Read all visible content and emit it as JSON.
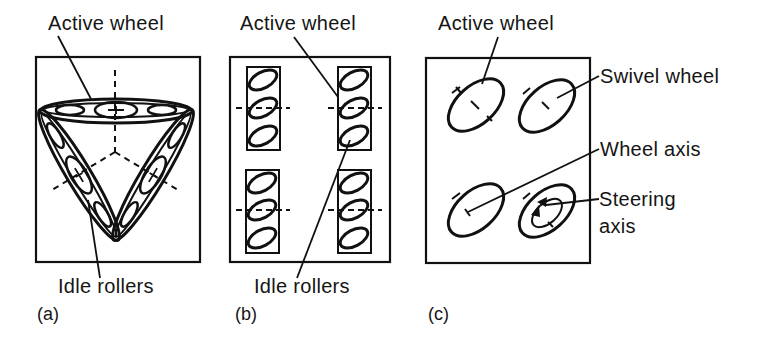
{
  "panels": {
    "a": {
      "tag": "(a)",
      "label_top": "Active wheel",
      "label_bottom": "Idle rollers"
    },
    "b": {
      "tag": "(b)",
      "label_top": "Active wheel",
      "label_bottom": "Idle rollers"
    },
    "c": {
      "tag": "(c)",
      "label_top": "Active wheel",
      "label_swivel": "Swivel wheel",
      "label_axis": "Wheel axis",
      "label_steering_line1": "Steering",
      "label_steering_line2": "axis"
    }
  },
  "colors": {
    "ink": "#111111",
    "background": "#ffffff"
  }
}
